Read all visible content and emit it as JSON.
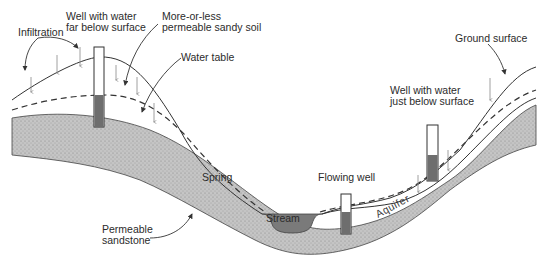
{
  "diagram": {
    "type": "geologic-cross-section",
    "colors": {
      "sandstone": "#bdbdbd",
      "water": "#6e6e6e",
      "lines": "#333333",
      "background": "#ffffff"
    },
    "labels": {
      "infiltration": "Infiltration",
      "well_far_line1": "Well with water",
      "well_far_line2": "far below surface",
      "sandy_soil_line1": "More-or-less",
      "sandy_soil_line2": "permeable sandy soil",
      "water_table": "Water table",
      "ground_surface": "Ground surface",
      "well_near_line1": "Well with water",
      "well_near_line2": "just below surface",
      "spring": "Spring",
      "flowing_well": "Flowing well",
      "stream": "Stream",
      "aquifer": "Aquifer",
      "sandstone_line1": "Permeable",
      "sandstone_line2": "sandstone"
    }
  }
}
